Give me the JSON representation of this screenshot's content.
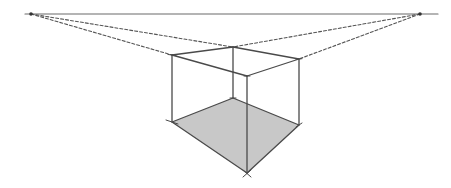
{
  "diagram": {
    "title": "",
    "type": "two-point-perspective",
    "colors": {
      "background": "#ffffff",
      "line": "#4a4a4a",
      "horizon": "#6a6a6a",
      "dashed": "#555555",
      "floor_fill": "#c8c8c8",
      "vanishing_point": "#333333"
    },
    "horizon": {
      "y": 14,
      "x1": 25,
      "x2": 438
    },
    "vanishing_points": {
      "left": {
        "x": 31,
        "y": 14
      },
      "right": {
        "x": 420,
        "y": 14
      }
    },
    "box": {
      "top": {
        "left": {
          "x": 172,
          "y": 55
        },
        "back": {
          "x": 233,
          "y": 47
        },
        "right": {
          "x": 299,
          "y": 59
        },
        "front": {
          "x": 247,
          "y": 76
        }
      },
      "bottom": {
        "left": {
          "x": 172,
          "y": 122
        },
        "back": {
          "x": 233,
          "y": 98
        },
        "right": {
          "x": 299,
          "y": 125
        },
        "front": {
          "x": 247,
          "y": 173
        }
      }
    }
  }
}
